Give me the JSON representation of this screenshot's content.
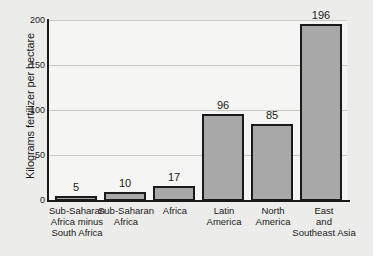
{
  "chart_data": {
    "type": "bar",
    "title": "",
    "xlabel": "",
    "ylabel": "Kilograms fertilizer per hectare",
    "ylim": [
      0,
      200
    ],
    "yticks": [
      0,
      50,
      100,
      150,
      200
    ],
    "ytick_labels": [
      "0",
      "50",
      "100",
      "150",
      "200"
    ],
    "grid": true,
    "legend": null,
    "categories": [
      "Sub-Saharan\nAfrica minus\nSouth Africa",
      "Sub-Saharan\nAfrica",
      "Africa",
      "Latin\nAmerica",
      "North\nAmerica",
      "East\nand\nSoutheast Asia"
    ],
    "values": [
      5,
      10,
      17,
      96,
      85,
      196
    ],
    "value_labels": [
      "5",
      "10",
      "17",
      "96",
      "85",
      "196"
    ],
    "colors": {
      "bar_fill": "#a8a8a8",
      "bar_border": "#1a1a1a",
      "plot_background": "#f5f5f3",
      "page_background": "#ececea",
      "gridline": "#c9c9c5",
      "text": "#1a1a1a"
    }
  }
}
